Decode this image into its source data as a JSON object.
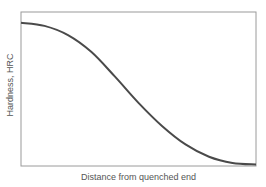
{
  "chart_data": {
    "type": "line",
    "title": "",
    "xlabel": "Distance from quenched end",
    "ylabel": "Hardness, HRC",
    "grid": false,
    "legend": null,
    "x_ticks": [],
    "y_ticks": [],
    "series": [
      {
        "name": "Jominy hardness curve",
        "color": "#4a4a4a",
        "x": [
          0,
          0.1,
          0.2,
          0.3,
          0.4,
          0.5,
          0.6,
          0.7,
          0.8,
          0.9,
          1.0
        ],
        "y": [
          0.93,
          0.91,
          0.85,
          0.74,
          0.58,
          0.41,
          0.26,
          0.14,
          0.06,
          0.02,
          0.01
        ]
      }
    ],
    "xlim": [
      0,
      1
    ],
    "ylim": [
      0,
      1
    ]
  },
  "colors": {
    "axis": "#9a9a9a",
    "curve": "#4a4a4a",
    "text": "#555555"
  }
}
